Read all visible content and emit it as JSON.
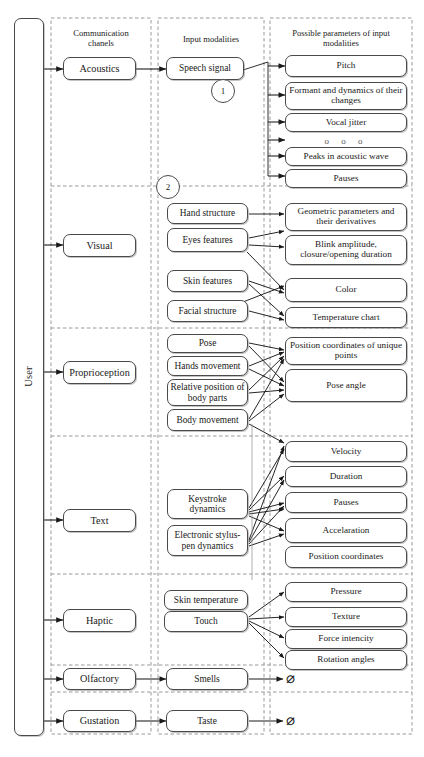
{
  "diagram": {
    "user_label": "User",
    "columns": [
      {
        "id": "channels",
        "header": "Communication\nchanels"
      },
      {
        "id": "modalities",
        "header": "Input modalities"
      },
      {
        "id": "parameters",
        "header": "Possible parameters of input\nmodalities"
      }
    ],
    "callouts": [
      {
        "label": "1"
      },
      {
        "label": "2"
      }
    ],
    "ellipsis": "o  o  o",
    "empty_symbol": "⌀",
    "rows": [
      {
        "channel": "Acoustics",
        "modalities": [
          "Speech signal"
        ],
        "parameters": [
          "Pitch",
          "Formant and dynamics of their changes",
          "Vocal jitter",
          "",
          "Peaks in acoustic wave",
          "Pauses"
        ]
      },
      {
        "channel": "Visual",
        "modalities": [
          "Hand structure",
          "Eyes features",
          "Skin features",
          "Facial structure"
        ],
        "parameters": [
          "Geometric parameters and their derivatives",
          "Blink amplitude, closure/opening duration",
          "Color",
          "Temperature chart"
        ]
      },
      {
        "channel": "Proprioception",
        "modalities": [
          "Pose",
          "Hands movement",
          "Relative position of body parts",
          "Body movement"
        ],
        "parameters": [
          "Position coordinates of unique points",
          "Pose angle"
        ]
      },
      {
        "channel": "Text",
        "modalities": [
          "Keystroke dynamics",
          "Electronic stylus-pen dynamics"
        ],
        "parameters": [
          "Velocity",
          "Duration",
          "Pauses",
          "Accelaration",
          "Position coordinates"
        ]
      },
      {
        "channel": "Haptic",
        "modalities": [
          "Skin temperature",
          "Touch"
        ],
        "parameters": [
          "Pressure",
          "Texture",
          "Force intencity",
          "Rotation angles"
        ]
      },
      {
        "channel": "Olfactory",
        "modalities": [
          "Smells"
        ],
        "parameters": [
          "⌀"
        ]
      },
      {
        "channel": "Gustation",
        "modalities": [
          "Taste"
        ],
        "parameters": [
          "⌀"
        ]
      }
    ],
    "colors": {
      "stroke": "#4a4a4a",
      "dashed": "#9a9a9a",
      "background": "#ffffff",
      "text": "#1a1a1a"
    }
  }
}
